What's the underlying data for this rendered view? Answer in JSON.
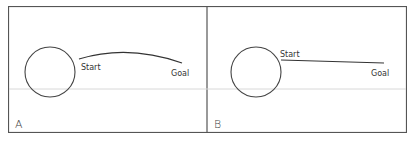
{
  "figure": {
    "panels": [
      {
        "id": "A",
        "label": "A",
        "path_type": "curved",
        "start_label": "Start",
        "goal_label": "Goal"
      },
      {
        "id": "B",
        "label": "B",
        "path_type": "straight",
        "start_label": "Start",
        "goal_label": "Goal"
      }
    ],
    "colors": {
      "line": "#333333",
      "frame": "#555555",
      "background": "#ffffff"
    }
  }
}
